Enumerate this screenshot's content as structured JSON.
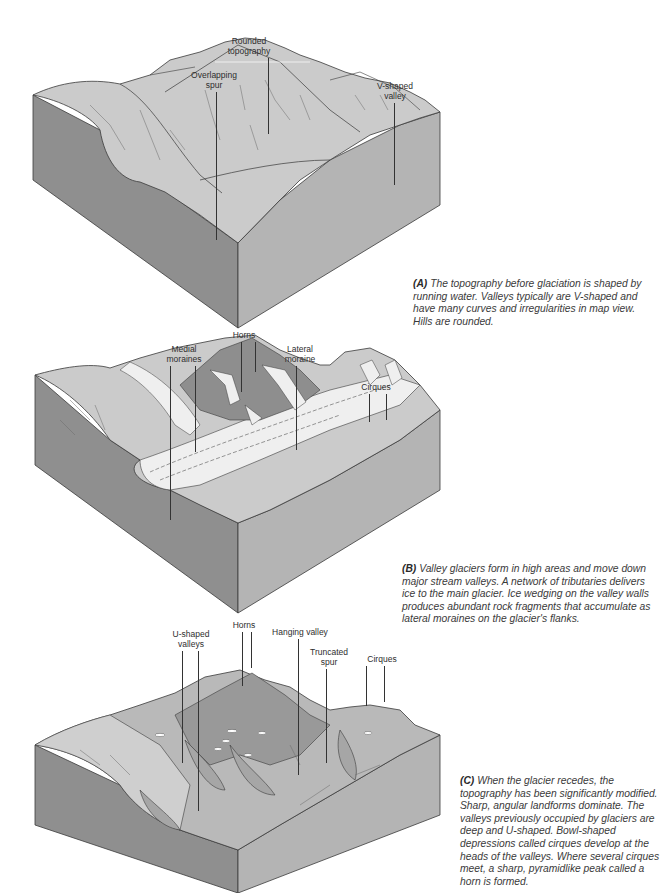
{
  "figure": {
    "panels": [
      {
        "id": "A",
        "labels": [
          {
            "text": "Rounded\ntopography"
          },
          {
            "text": "Overlapping\nspur"
          },
          {
            "text": "V-shaped\nvalley"
          }
        ],
        "caption_tag": "(A)",
        "caption": " The topography before glaciation is shaped by running water. Valleys typically are V-shaped and have many curves and irregularities in map view. Hills are rounded."
      },
      {
        "id": "B",
        "labels": [
          {
            "text": "Horns"
          },
          {
            "text": "Medial\nmoraines"
          },
          {
            "text": "Lateral\nmoraine"
          },
          {
            "text": "Cirques"
          }
        ],
        "caption_tag": "(B)",
        "caption": " Valley glaciers form in high areas and move down major stream valleys. A network of tributaries delivers ice to the main glacier. Ice wedging on the valley walls produces abundant rock fragments that accumulate as lateral moraines on the glacier's flanks."
      },
      {
        "id": "C",
        "labels": [
          {
            "text": "Horns"
          },
          {
            "text": "U-shaped\nvalleys"
          },
          {
            "text": "Hanging valley"
          },
          {
            "text": "Truncated\nspur"
          },
          {
            "text": "Cirques"
          }
        ],
        "caption_tag": "(C)",
        "caption": " When the glacier recedes, the topography has been significantly modified. Sharp, angular landforms dominate. The valleys previously occupied by glaciers are deep and U-shaped. Bowl-shaped depressions called cirques develop at the heads of the valleys. Where several cirques meet, a sharp, pyramidlike peak called a horn is formed."
      }
    ]
  },
  "colors": {
    "block_left_side": "#8f8f8f",
    "block_front_side": "#b4b4b4",
    "terrain_top": "#c9c9c9",
    "terrain_dark": "#8a8a8a",
    "ice": "#efefef",
    "line": "#3a3a3a"
  }
}
